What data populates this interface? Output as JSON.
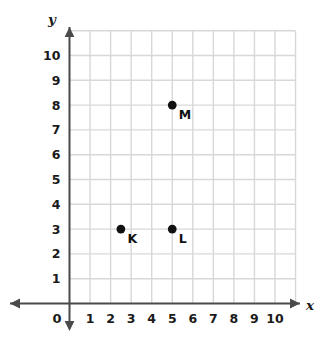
{
  "chart_data": {
    "type": "scatter",
    "title": "",
    "xlabel": "x",
    "ylabel": "y",
    "xlim": [
      0,
      11
    ],
    "ylim": [
      0,
      11
    ],
    "grid": true,
    "legend": false,
    "x_ticks": [
      "0",
      "1",
      "2",
      "3",
      "4",
      "5",
      "6",
      "7",
      "8",
      "9",
      "10"
    ],
    "y_ticks": [
      "1",
      "2",
      "3",
      "4",
      "5",
      "6",
      "7",
      "8",
      "9",
      "10"
    ],
    "points": [
      {
        "label": "K",
        "x": 2.5,
        "y": 3
      },
      {
        "label": "L",
        "x": 5,
        "y": 3
      },
      {
        "label": "M",
        "x": 5,
        "y": 8
      }
    ]
  },
  "axes": {
    "x_name": "x",
    "y_name": "y",
    "origin_label": "0"
  },
  "colors": {
    "grid": "#d8d8d8",
    "axis": "#4a4a4a",
    "point": "#111111",
    "text": "#1a1a1a",
    "background": "#ffffff"
  }
}
